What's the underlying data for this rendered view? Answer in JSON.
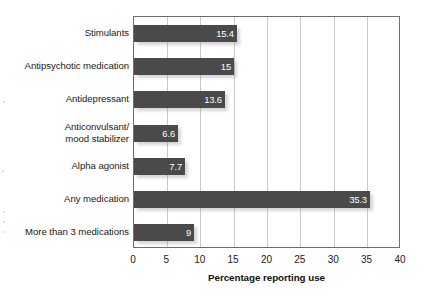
{
  "chart_data": {
    "type": "bar",
    "orientation": "horizontal",
    "title": "",
    "xlabel": "Percentage reporting use",
    "ylabel": "",
    "xlim": [
      0,
      40
    ],
    "xticks": [
      0,
      5,
      10,
      15,
      20,
      25,
      30,
      35,
      40
    ],
    "xtick_labels": [
      "0",
      "5",
      "10",
      "15",
      "20",
      "25",
      "30",
      "35",
      "40"
    ],
    "grid": "vertical",
    "legend": "none",
    "categories": [
      "Stimulants",
      "Antipsychotic medication",
      "Antidepressant",
      "Anticonvulsant/\nmood stabilizer",
      "Alpha agonist",
      "Any medication",
      "More than 3 medications"
    ],
    "values": [
      15.4,
      15,
      13.6,
      6.6,
      7.7,
      35.3,
      9
    ],
    "value_labels": [
      "15.4",
      "15",
      "13.6",
      "6.6",
      "7.7",
      "35.3",
      "9"
    ],
    "bar_color": "#4a4a4a",
    "value_label_color": "#ffffff",
    "gridline_color": "#c8c8c8",
    "axis_color": "#6e6e6e",
    "background_color": "#ffffff"
  }
}
